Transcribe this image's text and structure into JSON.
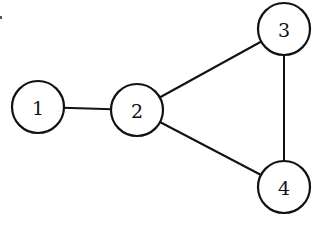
{
  "diagram": {
    "type": "undirected-graph",
    "colors": {
      "stroke": "#111111",
      "fill": "#ffffff",
      "background": "#ffffff"
    },
    "node_radius": 26,
    "nodes": [
      {
        "id": "1",
        "label": "1",
        "x": 38,
        "y": 107
      },
      {
        "id": "2",
        "label": "2",
        "x": 137,
        "y": 110
      },
      {
        "id": "3",
        "label": "3",
        "x": 284,
        "y": 29
      },
      {
        "id": "4",
        "label": "4",
        "x": 284,
        "y": 187
      }
    ],
    "edges": [
      {
        "from": "1",
        "to": "2"
      },
      {
        "from": "2",
        "to": "3"
      },
      {
        "from": "2",
        "to": "4"
      },
      {
        "from": "3",
        "to": "4"
      }
    ]
  }
}
